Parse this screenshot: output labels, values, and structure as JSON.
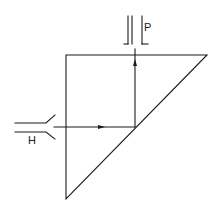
{
  "diagram": {
    "type": "optical prism light-path schematic",
    "stroke_color": "#1a1a1a",
    "background": "#ffffff",
    "labels": {
      "input": "H",
      "output": "P"
    },
    "elements": [
      "right-angle prism (triangle)",
      "input beam channel H (left)",
      "output beam channel P (top)",
      "horizontal ray with arrow",
      "vertical reflected ray with arrow"
    ]
  }
}
